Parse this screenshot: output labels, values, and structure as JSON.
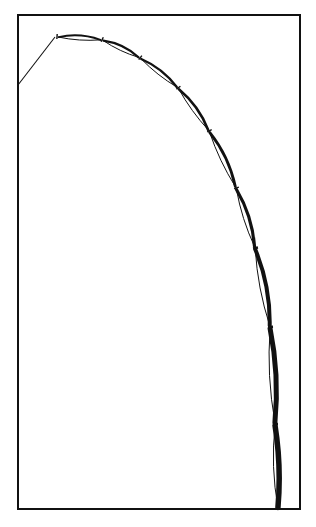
{
  "figure": {
    "type": "line-drawing",
    "width": 316,
    "height": 527,
    "colors": {
      "ink": "#111111",
      "paper": "#ffffff"
    },
    "frame": {
      "x1": 18,
      "y1": 15,
      "x2": 300,
      "y2": 509
    },
    "lead_line": [
      [
        18,
        85
      ],
      [
        55,
        37
      ]
    ],
    "joints": [
      [
        57,
        37
      ],
      [
        102,
        40
      ],
      [
        140,
        58
      ],
      [
        178,
        88
      ],
      [
        209,
        131
      ],
      [
        236,
        188
      ],
      [
        255,
        248
      ],
      [
        270,
        327
      ],
      [
        275,
        424
      ],
      [
        278,
        509
      ]
    ],
    "segments": [
      {
        "bulge_out": 3.0,
        "bulge_in": 1.5,
        "outer_w": 2.0,
        "inner_w": 1.0
      },
      {
        "bulge_out": 3.0,
        "bulge_in": 1.5,
        "outer_w": 2.2,
        "inner_w": 1.0
      },
      {
        "bulge_out": 3.0,
        "bulge_in": 1.5,
        "outer_w": 2.4,
        "inner_w": 1.0
      },
      {
        "bulge_out": 3.2,
        "bulge_in": 1.5,
        "outer_w": 2.6,
        "inner_w": 1.0
      },
      {
        "bulge_out": 3.5,
        "bulge_in": 1.8,
        "outer_w": 2.8,
        "inner_w": 1.0
      },
      {
        "bulge_out": 3.5,
        "bulge_in": 2.0,
        "outer_w": 3.2,
        "inner_w": 1.0
      },
      {
        "bulge_out": 4.0,
        "bulge_in": 2.5,
        "outer_w": 4.0,
        "inner_w": 1.0
      },
      {
        "bulge_out": 3.5,
        "bulge_in": 3.0,
        "outer_w": 5.0,
        "inner_w": 1.0
      },
      {
        "bulge_out": 2.5,
        "bulge_in": 3.0,
        "outer_w": 5.5,
        "inner_w": 1.0
      }
    ]
  }
}
